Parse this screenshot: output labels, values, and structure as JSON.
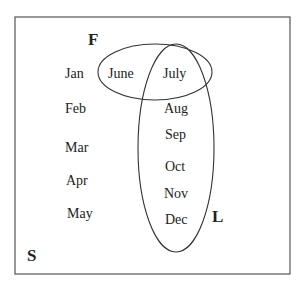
{
  "diagram": {
    "type": "venn",
    "universal_set": {
      "label": "S"
    },
    "sets": [
      {
        "id": "F",
        "label": "F"
      },
      {
        "id": "L",
        "label": "L"
      }
    ],
    "regions": {
      "outside": [
        "Jan",
        "Feb",
        "Mar",
        "Apr",
        "May"
      ],
      "F_only": [
        "June"
      ],
      "F_and_L": [
        "July"
      ],
      "L_only": [
        "Aug",
        "Sep",
        "Oct",
        "Nov",
        "Dec"
      ]
    },
    "elements": {
      "jan": "Jan",
      "feb": "Feb",
      "mar": "Mar",
      "apr": "Apr",
      "may": "May",
      "june": "June",
      "july": "July",
      "aug": "Aug",
      "sep": "Sep",
      "oct": "Oct",
      "nov": "Nov",
      "dec": "Dec"
    },
    "colors": {
      "stroke": "#333333",
      "text": "#222222",
      "background": "#ffffff"
    }
  }
}
